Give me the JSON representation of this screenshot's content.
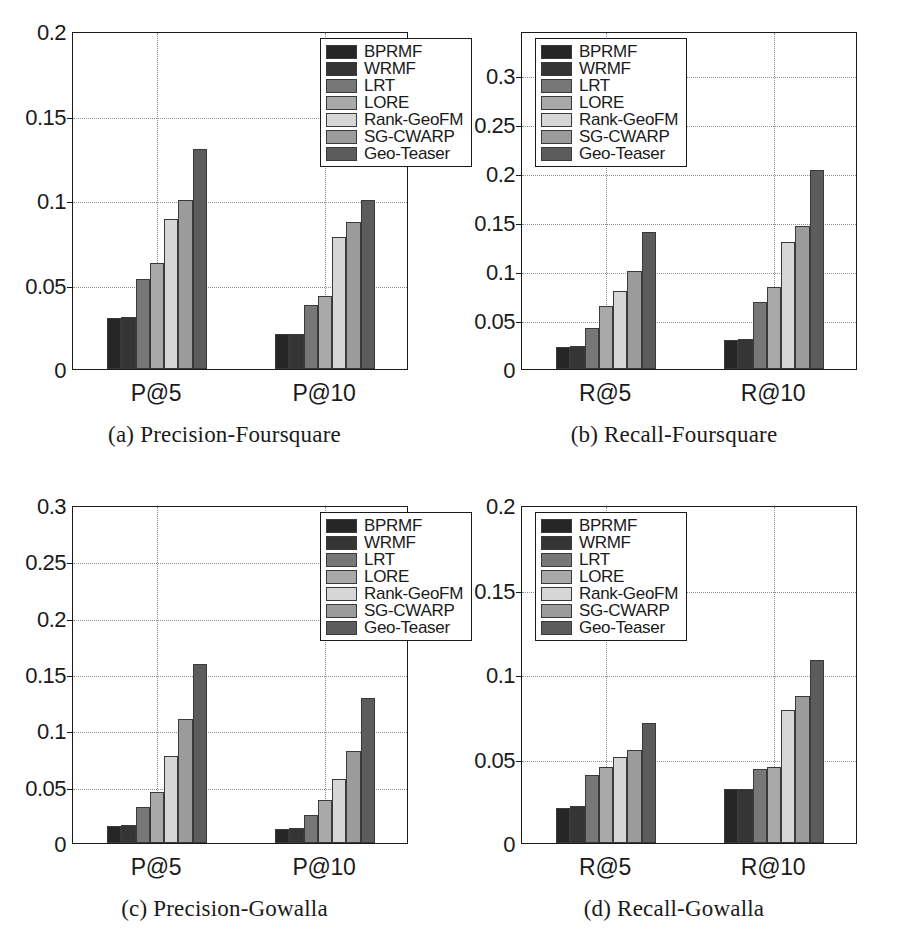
{
  "figure": {
    "series_names": [
      "BPRMF",
      "WRMF",
      "LRT",
      "LORE",
      "Rank-GeoFM",
      "SG-CWARP",
      "Geo-Teaser"
    ],
    "series_colors": [
      "#262626",
      "#353535",
      "#777777",
      "#a9a9a9",
      "#d6d6d6",
      "#9b9b9b",
      "#5c5c5c"
    ]
  },
  "chart_data": [
    {
      "type": "bar",
      "panel": "a",
      "title": "(a) Precision-Foursquare",
      "xlabel": "",
      "ylabel": "",
      "categories": [
        "P@5",
        "P@10"
      ],
      "ylim": [
        0,
        0.2
      ],
      "yticks": [
        0,
        0.05,
        0.1,
        0.15,
        0.2
      ],
      "ytick_labels": [
        "0",
        "0.05",
        "0.1",
        "0.15",
        "0.2"
      ],
      "grid": true,
      "legend_position": "upper-right",
      "series": [
        {
          "name": "BPRMF",
          "values": [
            0.03,
            0.021
          ]
        },
        {
          "name": "WRMF",
          "values": [
            0.031,
            0.021
          ]
        },
        {
          "name": "LRT",
          "values": [
            0.053,
            0.038
          ]
        },
        {
          "name": "LORE",
          "values": [
            0.063,
            0.043
          ]
        },
        {
          "name": "Rank-GeoFM",
          "values": [
            0.089,
            0.078
          ]
        },
        {
          "name": "SG-CWARP",
          "values": [
            0.1,
            0.087
          ]
        },
        {
          "name": "Geo-Teaser",
          "values": [
            0.13,
            0.1
          ]
        }
      ]
    },
    {
      "type": "bar",
      "panel": "b",
      "title": "(b) Recall-Foursquare",
      "xlabel": "",
      "ylabel": "",
      "categories": [
        "R@5",
        "R@10"
      ],
      "ylim": [
        0,
        0.345
      ],
      "yticks": [
        0,
        0.05,
        0.1,
        0.15,
        0.2,
        0.25,
        0.3
      ],
      "ytick_labels": [
        "0",
        "0.05",
        "0.1",
        "0.15",
        "0.2",
        "0.25",
        "0.3"
      ],
      "grid": true,
      "legend_position": "upper-left",
      "series": [
        {
          "name": "BPRMF",
          "values": [
            0.022,
            0.03
          ]
        },
        {
          "name": "WRMF",
          "values": [
            0.023,
            0.031
          ]
        },
        {
          "name": "LRT",
          "values": [
            0.042,
            0.068
          ]
        },
        {
          "name": "LORE",
          "values": [
            0.064,
            0.084
          ]
        },
        {
          "name": "Rank-GeoFM",
          "values": [
            0.08,
            0.13
          ]
        },
        {
          "name": "SG-CWARP",
          "values": [
            0.1,
            0.146
          ]
        },
        {
          "name": "Geo-Teaser",
          "values": [
            0.14,
            0.203
          ]
        }
      ]
    },
    {
      "type": "bar",
      "panel": "c",
      "title": "(c) Precision-Gowalla",
      "xlabel": "",
      "ylabel": "",
      "categories": [
        "P@5",
        "P@10"
      ],
      "ylim": [
        0,
        0.3
      ],
      "yticks": [
        0,
        0.05,
        0.1,
        0.15,
        0.2,
        0.25,
        0.3
      ],
      "ytick_labels": [
        "0",
        "0.05",
        "0.1",
        "0.15",
        "0.2",
        "0.25",
        "0.3"
      ],
      "grid": true,
      "legend_position": "upper-right",
      "series": [
        {
          "name": "BPRMF",
          "values": [
            0.015,
            0.012
          ]
        },
        {
          "name": "WRMF",
          "values": [
            0.016,
            0.013
          ]
        },
        {
          "name": "LRT",
          "values": [
            0.032,
            0.025
          ]
        },
        {
          "name": "LORE",
          "values": [
            0.045,
            0.038
          ]
        },
        {
          "name": "Rank-GeoFM",
          "values": [
            0.077,
            0.057
          ]
        },
        {
          "name": "SG-CWARP",
          "values": [
            0.11,
            0.082
          ]
        },
        {
          "name": "Geo-Teaser",
          "values": [
            0.159,
            0.129
          ]
        }
      ]
    },
    {
      "type": "bar",
      "panel": "d",
      "title": "(d) Recall-Gowalla",
      "xlabel": "",
      "ylabel": "",
      "categories": [
        "R@5",
        "R@10"
      ],
      "ylim": [
        0,
        0.2
      ],
      "yticks": [
        0,
        0.05,
        0.1,
        0.15,
        0.2
      ],
      "ytick_labels": [
        "0",
        "0.05",
        "0.1",
        "0.15",
        "0.2"
      ],
      "grid": true,
      "legend_position": "upper-left",
      "series": [
        {
          "name": "BPRMF",
          "values": [
            0.021,
            0.032
          ]
        },
        {
          "name": "WRMF",
          "values": [
            0.022,
            0.032
          ]
        },
        {
          "name": "LRT",
          "values": [
            0.04,
            0.044
          ]
        },
        {
          "name": "LORE",
          "values": [
            0.045,
            0.045
          ]
        },
        {
          "name": "Rank-GeoFM",
          "values": [
            0.051,
            0.079
          ]
        },
        {
          "name": "SG-CWARP",
          "values": [
            0.055,
            0.087
          ]
        },
        {
          "name": "Geo-Teaser",
          "values": [
            0.071,
            0.108
          ]
        }
      ]
    }
  ]
}
